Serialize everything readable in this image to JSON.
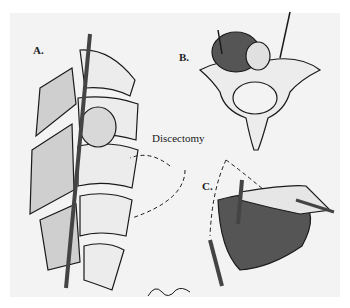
{
  "figure": {
    "panels": [
      {
        "id": "A",
        "label": "A.",
        "description": "Lateral view of spine segment with rod and discectomy sites"
      },
      {
        "id": "B",
        "label": "B.",
        "description": "Axial view of vertebra with disc herniation and instrument"
      },
      {
        "id": "C",
        "label": "C.",
        "description": "Oblique view of vertebral body with rod and dashed motion arrows"
      }
    ],
    "callout": "Discectomy",
    "signature": "artist-signature",
    "colors": {
      "background": "#ffffff",
      "panel": "#f3f3f3",
      "ink": "#1a1a1a"
    }
  }
}
